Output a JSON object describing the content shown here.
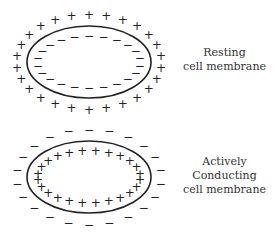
{
  "colors": {
    "stroke": "#222222",
    "text": "#333333",
    "background": "#ffffff"
  },
  "membranes": [
    {
      "id": "resting",
      "label_lines": [
        "Resting",
        "cell membrane"
      ],
      "ellipse": {
        "cx": 89,
        "cy": 62,
        "rx": 62,
        "ry": 36
      },
      "outer_charge": "+",
      "outer_count": 26,
      "inner_charge": "−",
      "inner_count": 22
    },
    {
      "id": "active",
      "label_lines": [
        "Actively",
        "Conducting",
        "cell membrane"
      ],
      "ellipse": {
        "cx": 89,
        "cy": 177,
        "rx": 62,
        "ry": 36
      },
      "outer_charge": "−",
      "outer_count": 22,
      "inner_charge": "+",
      "inner_count": 24
    }
  ]
}
